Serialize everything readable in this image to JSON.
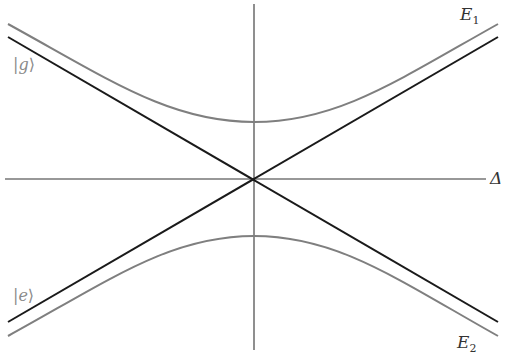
{
  "diagram": {
    "type": "avoided-crossing energy diagram",
    "axes": {
      "horizontal_label": "Δ",
      "vertical_label": ""
    },
    "labels": {
      "upper_branch": {
        "symbol": "E",
        "subscript": "1"
      },
      "lower_branch": {
        "symbol": "E",
        "subscript": "2"
      },
      "ground_state": "|g⟩",
      "excited_state": "|e⟩",
      "ground_state_ket_open": "|",
      "ground_state_letter": "g",
      "ground_state_ket_close": "⟩",
      "excited_state_ket_open": "|",
      "excited_state_letter": "e",
      "excited_state_ket_close": "⟩"
    },
    "curves": [
      {
        "name": "dressed-upper",
        "style": "gray",
        "shape": "hyperbola",
        "apex": [
          254,
          122
        ]
      },
      {
        "name": "dressed-lower",
        "style": "gray",
        "shape": "hyperbola",
        "apex": [
          254,
          236
        ]
      },
      {
        "name": "bare-g",
        "style": "black",
        "shape": "line",
        "from": [
          8,
          37
        ],
        "to": [
          498,
          322
        ]
      },
      {
        "name": "bare-e",
        "style": "black",
        "shape": "line",
        "from": [
          8,
          322
        ],
        "to": [
          498,
          37
        ]
      }
    ],
    "colors": {
      "axis": "#333333",
      "bare_line": "#1a1a1a",
      "dressed_curve": "#7f7f7f",
      "ket_label": "#8a8a8a"
    }
  }
}
